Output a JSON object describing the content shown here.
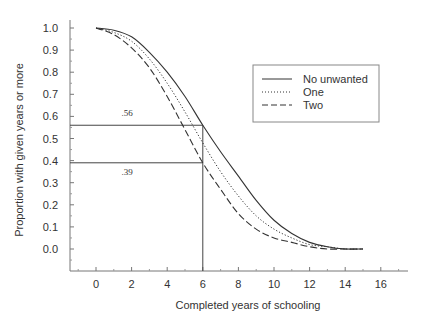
{
  "chart_data": {
    "type": "line",
    "title": "",
    "xlabel": "Completed years of schooling",
    "ylabel": "Proportion with given years or more",
    "xlim": [
      -1.5,
      17.5
    ],
    "ylim": [
      -0.1,
      1.05
    ],
    "x_ticks": [
      "0",
      "2",
      "4",
      "6",
      "8",
      "10",
      "12",
      "14",
      "16"
    ],
    "y_ticks": [
      "1.0",
      "0.9",
      "0.8",
      "0.7",
      "0.6",
      "0.5",
      "0.4",
      "0.3",
      "0.2",
      "0.1",
      "0.0"
    ],
    "grid": false,
    "legend_position": "upper right",
    "x": [
      0,
      1,
      2,
      3,
      4,
      5,
      6,
      7,
      8,
      9,
      10,
      11,
      12,
      13,
      14,
      15
    ],
    "series": [
      {
        "name": "No unwanted",
        "style": "solid",
        "values": [
          1.0,
          0.99,
          0.96,
          0.89,
          0.8,
          0.69,
          0.56,
          0.44,
          0.33,
          0.22,
          0.13,
          0.07,
          0.03,
          0.01,
          0.0,
          0.0
        ]
      },
      {
        "name": "One",
        "style": "dotted",
        "values": [
          1.0,
          0.98,
          0.94,
          0.86,
          0.75,
          0.62,
          0.48,
          0.35,
          0.24,
          0.15,
          0.09,
          0.05,
          0.02,
          0.01,
          0.0,
          0.0
        ]
      },
      {
        "name": "Two",
        "style": "dashed",
        "values": [
          1.0,
          0.97,
          0.91,
          0.82,
          0.69,
          0.54,
          0.39,
          0.27,
          0.16,
          0.09,
          0.05,
          0.03,
          0.01,
          0.0,
          0.0,
          0.0
        ]
      }
    ],
    "annotations": [
      {
        "text": ".56",
        "x_ref": 6,
        "y_ref": 0.56
      },
      {
        "text": ".39",
        "x_ref": 6,
        "y_ref": 0.39
      }
    ],
    "reference_lines": {
      "vertical_x": 6,
      "horizontal_y": [
        0.56,
        0.39
      ]
    }
  }
}
